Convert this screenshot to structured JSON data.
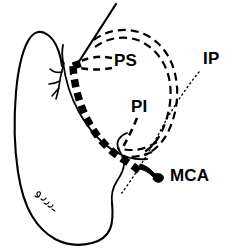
{
  "figure": {
    "background_color": "#ffffff",
    "ink_color": "#000000",
    "width": 238,
    "height": 250
  },
  "labels": [
    {
      "id": "ps",
      "text": "PS",
      "x": 114,
      "y": 62,
      "description": "Proximal superior portal label"
    },
    {
      "id": "pi",
      "text": "PI",
      "x": 131,
      "y": 108,
      "description": "Proximal inferior portal label"
    },
    {
      "id": "ip",
      "text": "IP",
      "x": 203,
      "y": 60,
      "description": "Iliopsoas label"
    },
    {
      "id": "mca",
      "text": "MCA",
      "x": 170,
      "y": 177,
      "description": "Medial circumflex artery label"
    }
  ],
  "structures": [
    {
      "id": "femur-outline",
      "name": "femur-outline",
      "style": "solid"
    },
    {
      "id": "femoral-neck-contour",
      "name": "femoral-neck-contour",
      "style": "solid"
    },
    {
      "id": "acetabular-arc",
      "name": "acetabular-arc",
      "style": "solid"
    },
    {
      "id": "thick-dashed-capsule",
      "name": "capsular-incision",
      "style": "thick-dashed"
    },
    {
      "id": "double-dashed-loop",
      "name": "labrum-outline",
      "style": "thin-dashed"
    },
    {
      "id": "mca-vessel",
      "name": "mca-vessel",
      "style": "solid-fill"
    },
    {
      "id": "vessel-branches",
      "name": "retinacular-vessels",
      "style": "solid"
    },
    {
      "id": "needle",
      "name": "instrument-line",
      "style": "solid"
    },
    {
      "id": "ip-leader",
      "name": "ip-leader-line",
      "style": "dotted"
    },
    {
      "id": "artist-signature",
      "name": "artist-signature",
      "style": "scribble"
    }
  ]
}
